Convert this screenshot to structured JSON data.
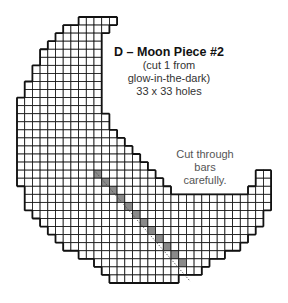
{
  "title": "D – Moon Piece #2",
  "subtitle_lines": [
    "(cut 1 from",
    "glow-in-the-dark)",
    "33 x 33 holes"
  ],
  "note_lines": [
    "Cut through",
    "bars",
    "carefully."
  ],
  "colors": {
    "line": "#111111",
    "cut_fill": "#8a8a8a",
    "background": "#ffffff"
  },
  "chart_data": {
    "type": "diagram",
    "grid_size": [
      33,
      33
    ],
    "rows": [
      [
        8,
        13
      ],
      [
        6,
        12
      ],
      [
        5,
        11
      ],
      [
        4,
        11
      ],
      [
        3,
        11
      ],
      [
        3,
        11
      ],
      [
        2,
        11
      ],
      [
        2,
        11
      ],
      [
        1,
        11
      ],
      [
        1,
        11
      ],
      [
        0,
        11
      ],
      [
        0,
        11
      ],
      [
        0,
        12
      ],
      [
        0,
        12
      ],
      [
        0,
        13
      ],
      [
        0,
        14
      ],
      [
        0,
        15
      ],
      [
        0,
        16
      ],
      [
        0,
        17
      ],
      [
        0,
        18
      ],
      [
        0,
        19
      ],
      [
        1,
        20
      ],
      [
        1,
        33
      ],
      [
        1,
        33
      ],
      [
        2,
        32
      ],
      [
        3,
        32
      ],
      [
        4,
        31
      ],
      [
        5,
        30
      ],
      [
        6,
        29
      ],
      [
        8,
        27
      ],
      [
        10,
        25
      ],
      [
        11,
        24
      ],
      [
        12,
        21
      ]
    ],
    "right_tip_rows": {
      "19": [
        31,
        33
      ],
      "20": [
        31,
        33
      ],
      "21": [
        30,
        33
      ]
    },
    "cut_bar_cells": [
      [
        19,
        10
      ],
      [
        20,
        11
      ],
      [
        21,
        12
      ],
      [
        22,
        13
      ],
      [
        23,
        14
      ],
      [
        24,
        15
      ],
      [
        25,
        16
      ],
      [
        26,
        17
      ],
      [
        27,
        18
      ],
      [
        28,
        19
      ],
      [
        29,
        20
      ],
      [
        30,
        21
      ]
    ],
    "bold_divider_rows": [
      12
    ],
    "bold_divider_cols": [
      10,
      18
    ]
  }
}
